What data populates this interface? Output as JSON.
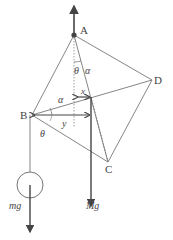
{
  "diagram": {
    "points": {
      "A": {
        "label": "A",
        "x": 74,
        "y": 35
      },
      "B": {
        "label": "B",
        "x": 32,
        "y": 115
      },
      "C": {
        "label": "C",
        "x": 108,
        "y": 162
      },
      "D": {
        "label": "D",
        "x": 152,
        "y": 80
      },
      "G": {
        "x": 91,
        "y": 97
      }
    },
    "labels": {
      "theta_top": "θ",
      "alpha_top": "α",
      "alpha_mid": "α",
      "x_dim": "x",
      "y_dim": "y",
      "theta_bottom": "θ",
      "mg": "mg",
      "Mg": "Mg"
    },
    "colors": {
      "line": "#555555",
      "thin": "#777777",
      "text": "#444444"
    }
  }
}
